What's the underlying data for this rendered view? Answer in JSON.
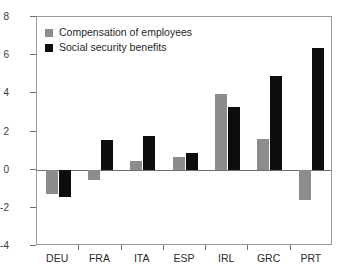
{
  "chart_data": {
    "type": "bar",
    "title": "",
    "subtitle": "",
    "xlabel": "",
    "ylabel": "",
    "ylim": [
      -4,
      8
    ],
    "yticks": [
      -4,
      -2,
      0,
      2,
      4,
      6,
      8
    ],
    "ytick_labels": [
      "-4",
      "-2",
      "0",
      "2",
      "4",
      "6",
      "8"
    ],
    "grid": false,
    "legend_position": "top-left",
    "categories": [
      "DEU",
      "FRA",
      "ITA",
      "ESP",
      "IRL",
      "GRC",
      "PRT"
    ],
    "series": [
      {
        "name": "Compensation of employees",
        "color": "#8c8c8c",
        "values": [
          -1.25,
          -0.55,
          0.45,
          0.65,
          3.95,
          1.6,
          -1.6
        ]
      },
      {
        "name": "Social security benefits",
        "color": "#0d0d0d",
        "values": [
          -1.45,
          1.55,
          1.75,
          0.85,
          3.3,
          4.9,
          6.35
        ]
      }
    ]
  },
  "legend": {
    "items": [
      {
        "label": "Compensation of employees",
        "color": "#8c8c8c"
      },
      {
        "label": "Social security benefits",
        "color": "#0d0d0d"
      }
    ]
  },
  "axes": {
    "zero_line_color": "#6e6e6e",
    "frame_color": "#9a9a9a"
  }
}
